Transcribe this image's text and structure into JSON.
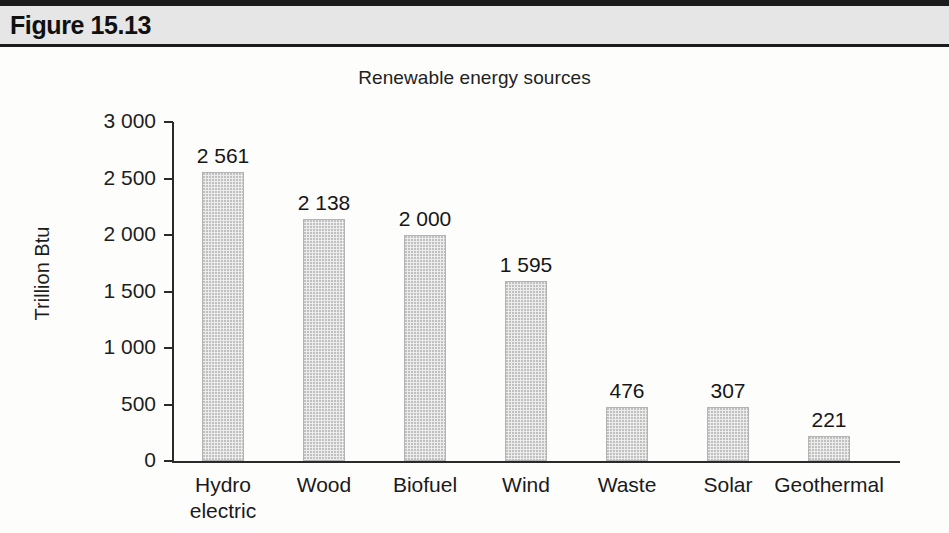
{
  "figure": {
    "label": "Figure 15.13"
  },
  "chart_data": {
    "type": "bar",
    "title": "Renewable energy sources",
    "xlabel": "",
    "ylabel": "Trillion Btu",
    "ylim": [
      0,
      3000
    ],
    "grid": false,
    "legend": false,
    "categories": [
      "Hydro\nelectric",
      "Wood",
      "Biofuel",
      "Wind",
      "Waste",
      "Solar",
      "Geothermal"
    ],
    "values": [
      2561,
      2138,
      2000,
      1595,
      476,
      307,
      221
    ],
    "value_labels": [
      "2 561",
      "2 138",
      "2 000",
      "1 595",
      "476",
      "307",
      "221"
    ],
    "ytick_values": [
      0,
      500,
      1000,
      1500,
      2000,
      2500,
      3000
    ],
    "ytick_labels": [
      "0",
      "500",
      "1 000",
      "1 500",
      "2 000",
      "2 500",
      "3 000"
    ],
    "bar_fill_color": "#ececec",
    "bar_border_color": "#b4b4b4",
    "axis_color": "#2a2a2a"
  }
}
